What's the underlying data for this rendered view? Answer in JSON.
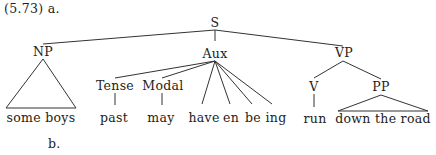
{
  "example": {
    "number": "(5.73) a.",
    "sub_b": "b."
  },
  "tree": {
    "S": "S",
    "NP": "NP",
    "Aux": "Aux",
    "VP": "VP",
    "Tense": "Tense",
    "Modal": "Modal",
    "V": "V",
    "PP": "PP",
    "leaves": {
      "np_text": "some boys",
      "tense": "past",
      "modal": "may",
      "have": "have",
      "en": "en",
      "be": "be",
      "ing": "ing",
      "verb": "run",
      "pp_text": "down the road"
    }
  }
}
